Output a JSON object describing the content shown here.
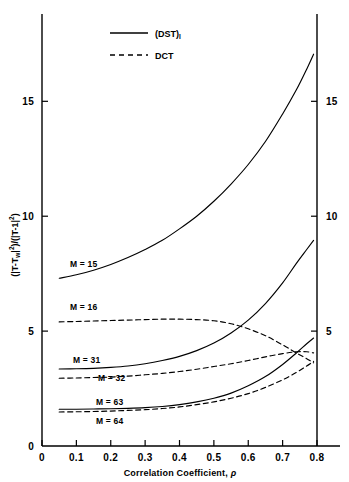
{
  "figure": {
    "background": "#ffffff",
    "ink_color": "#000000"
  },
  "legend": {
    "entries": [
      {
        "label": "(DST)",
        "sublabel": "I",
        "style": "solid",
        "name": "dst-legend"
      },
      {
        "label": "DCT",
        "sublabel": "",
        "style": "dashed",
        "name": "dct-legend"
      }
    ]
  },
  "axes": {
    "x_title_prefix": "Correlation Coefficient, ",
    "x_title_symbol": "ρ",
    "y_title": "(|T-T_w|^2)/(|T-1|^2)",
    "y_title_parts": {
      "open1": "(|T-T",
      "wsub": "w",
      "bar1": "|",
      "exp1": "2",
      "mid": ")/(|T-1|",
      "exp2": "2",
      "close": ")"
    },
    "x_ticks": [
      "0",
      "0.1",
      "0.2",
      "0.3",
      "0.4",
      "0.5",
      "0.6",
      "0.7",
      "0.8"
    ],
    "x_tick_values": [
      0,
      0.1,
      0.2,
      0.3,
      0.4,
      0.5,
      0.6,
      0.7,
      0.8
    ],
    "y_ticks_left": [
      "0",
      "5",
      "10",
      "15"
    ],
    "y_ticks_right": [
      "5",
      "10",
      "15"
    ],
    "y_tick_values": [
      0,
      5,
      10,
      15
    ],
    "xlim": [
      0,
      0.8
    ],
    "ylim": [
      0,
      18.8
    ]
  },
  "curve_labels": [
    {
      "text": "M = 15",
      "name": "label-m15"
    },
    {
      "text": "M = 16",
      "name": "label-m16"
    },
    {
      "text": "M = 31",
      "name": "label-m31"
    },
    {
      "text": "M = 32",
      "name": "label-m32"
    },
    {
      "text": "M = 63",
      "name": "label-m63"
    },
    {
      "text": "M = 64",
      "name": "label-m64"
    }
  ],
  "chart_data": {
    "type": "line",
    "title": "",
    "xlabel": "Correlation Coefficient, ρ",
    "ylabel": "(|T-T_w|²)/(|T-1|²)",
    "xlim": [
      0,
      0.8
    ],
    "ylim": [
      0,
      18.8
    ],
    "grid": false,
    "legend_position": "top-center",
    "x_ticks": [
      0,
      0.1,
      0.2,
      0.3,
      0.4,
      0.5,
      0.6,
      0.7,
      0.8
    ],
    "y_ticks": [
      0,
      5,
      10,
      15
    ],
    "dual_y_axis": true,
    "series": [
      {
        "name": "M = 15",
        "transform": "(DST)I",
        "style": "solid",
        "x": [
          0.05,
          0.1,
          0.15,
          0.2,
          0.25,
          0.3,
          0.35,
          0.4,
          0.45,
          0.5,
          0.55,
          0.6,
          0.65,
          0.7,
          0.74,
          0.77,
          0.79
        ],
        "y": [
          7.3,
          7.45,
          7.65,
          7.9,
          8.2,
          8.55,
          8.95,
          9.45,
          10.0,
          10.65,
          11.4,
          12.25,
          13.25,
          14.45,
          15.5,
          16.4,
          17.05
        ]
      },
      {
        "name": "M = 16",
        "transform": "DCT",
        "style": "dashed",
        "x": [
          0.05,
          0.1,
          0.15,
          0.2,
          0.25,
          0.3,
          0.35,
          0.4,
          0.45,
          0.5,
          0.55,
          0.6,
          0.65,
          0.7,
          0.74,
          0.77,
          0.79
        ],
        "y": [
          5.4,
          5.42,
          5.44,
          5.46,
          5.48,
          5.5,
          5.52,
          5.52,
          5.5,
          5.45,
          5.32,
          5.1,
          4.8,
          4.4,
          4.05,
          3.8,
          3.62
        ]
      },
      {
        "name": "M = 31",
        "transform": "(DST)I",
        "style": "solid",
        "x": [
          0.05,
          0.1,
          0.15,
          0.2,
          0.25,
          0.3,
          0.35,
          0.4,
          0.45,
          0.5,
          0.55,
          0.6,
          0.65,
          0.7,
          0.74,
          0.77,
          0.79
        ],
        "y": [
          3.35,
          3.36,
          3.38,
          3.42,
          3.48,
          3.58,
          3.72,
          3.9,
          4.15,
          4.48,
          4.92,
          5.48,
          6.2,
          7.1,
          7.95,
          8.55,
          8.95
        ]
      },
      {
        "name": "M = 32",
        "transform": "DCT",
        "style": "dashed",
        "x": [
          0.05,
          0.1,
          0.15,
          0.2,
          0.25,
          0.3,
          0.35,
          0.4,
          0.45,
          0.5,
          0.55,
          0.6,
          0.65,
          0.7,
          0.74,
          0.77,
          0.79
        ],
        "y": [
          2.95,
          2.96,
          2.98,
          3.0,
          3.04,
          3.1,
          3.16,
          3.24,
          3.34,
          3.46,
          3.58,
          3.72,
          3.88,
          4.02,
          4.1,
          4.1,
          4.05
        ]
      },
      {
        "name": "M = 63",
        "transform": "(DST)I",
        "style": "solid",
        "x": [
          0.05,
          0.1,
          0.15,
          0.2,
          0.25,
          0.3,
          0.35,
          0.4,
          0.45,
          0.5,
          0.55,
          0.6,
          0.65,
          0.7,
          0.74,
          0.77,
          0.79
        ],
        "y": [
          1.6,
          1.6,
          1.61,
          1.62,
          1.64,
          1.67,
          1.72,
          1.8,
          1.92,
          2.08,
          2.3,
          2.62,
          3.02,
          3.55,
          4.05,
          4.45,
          4.7
        ]
      },
      {
        "name": "M = 64",
        "transform": "DCT",
        "style": "dashed",
        "x": [
          0.05,
          0.1,
          0.15,
          0.2,
          0.25,
          0.3,
          0.35,
          0.4,
          0.45,
          0.5,
          0.55,
          0.6,
          0.65,
          0.7,
          0.74,
          0.77,
          0.79
        ],
        "y": [
          1.48,
          1.49,
          1.5,
          1.52,
          1.55,
          1.58,
          1.63,
          1.7,
          1.8,
          1.92,
          2.08,
          2.28,
          2.55,
          2.88,
          3.2,
          3.48,
          3.68
        ]
      }
    ]
  }
}
